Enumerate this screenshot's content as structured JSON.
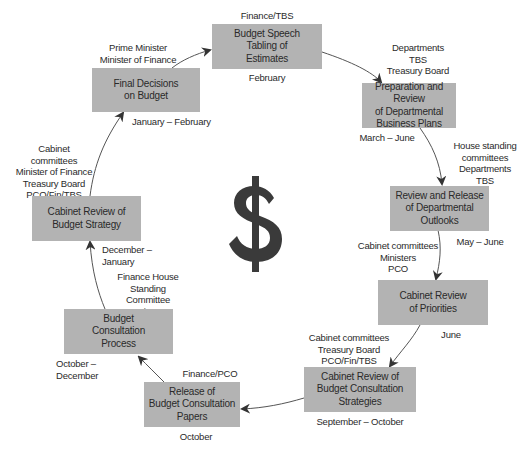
{
  "diagram": {
    "type": "cycle",
    "center_icon": "dollar-sign-icon",
    "colors": {
      "box_fill": "#b3b3b3",
      "text": "#2a2a2a",
      "arrow": "#333333",
      "dollar": "#3a3a3a"
    },
    "steps": [
      {
        "id": "budget-speech",
        "title": "Budget Speech\nTabling of\nEstimates",
        "actors": "Finance/TBS",
        "timing": "February"
      },
      {
        "id": "preparation-review",
        "title": "Preparation and Review\nof Departmental\nBusiness Plans",
        "actors": "Departments\nTBS\nTreasury Board",
        "timing": "March – June"
      },
      {
        "id": "review-release",
        "title": "Review and Release\nof Departmental\nOutlooks",
        "actors": "House standing\ncommittees\nDepartments\nTBS",
        "timing": "May – June"
      },
      {
        "id": "cabinet-review-priorities",
        "title": "Cabinet Review\nof Priorities",
        "actors": "Cabinet committees\nMinisters\nPCO",
        "timing": "June"
      },
      {
        "id": "cabinet-review-consultation-strategies",
        "title": "Cabinet Review of\nBudget Consultation\nStrategies",
        "actors": "Cabinet committees\nTreasury Board\nPCO/Fin/TBS",
        "timing": "September – October"
      },
      {
        "id": "release-consultation-papers",
        "title": "Release of\nBudget Consultation\nPapers",
        "actors": "Finance/PCO",
        "timing": "October"
      },
      {
        "id": "budget-consultation-process",
        "title": "Budget\nConsultation\nProcess",
        "actors": "Finance House\nStanding Committee\non Finance",
        "timing": "October – December"
      },
      {
        "id": "cabinet-review-budget-strategy",
        "title": "Cabinet Review of\nBudget Strategy",
        "actors": "Cabinet committees\nMinister of Finance\nTreasury Board\nPCO/Fin/TBS",
        "timing": "December – January"
      },
      {
        "id": "final-decisions",
        "title": "Final Decisions\non Budget",
        "actors": "Prime Minister\nMinister of Finance",
        "timing": "January – February"
      }
    ]
  }
}
